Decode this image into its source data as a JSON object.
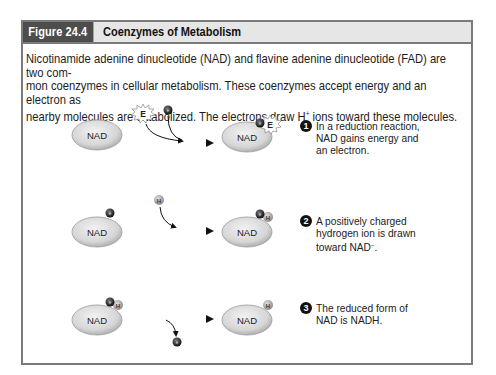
{
  "figure": {
    "label": "Figure 24.4",
    "title": "Coenzymes of Metabolism",
    "intro_line1": "Nicotinamide adenine dinucleotide (NAD) and flavine adenine dinucleotide (FAD) are two com-",
    "intro_line2": "mon coenzymes in cellular metabolism. These coenzymes accept energy and an electron as",
    "intro_line3_a": "nearby molecules are catabolized. The electrons draw H",
    "intro_line3_sup": "+",
    "intro_line3_b": " ions toward these molecules."
  },
  "molecule_label": "NAD",
  "particles": {
    "energy": "E",
    "electron": "e",
    "electron_sup": "−",
    "hydrogen": "H",
    "hydrogen_sup": "+"
  },
  "steps": [
    {
      "number": "1",
      "text": "In a reduction reaction, NAD gains energy and an electron."
    },
    {
      "number": "2",
      "text_a": "A positively charged hydrogen ion is drawn toward NAD",
      "text_sup": "−",
      "text_b": "."
    },
    {
      "number": "3",
      "text": "The reduced form of NAD is NADH."
    }
  ],
  "colors": {
    "frame": "#7a7a7a",
    "header_bg": "#e6e6e6",
    "label_bg": "#4d4d4d",
    "molecule_fill": "#d9d9d9",
    "electron_fill": "#2a2a2a",
    "hydrogen_fill": "#9a9a9a"
  }
}
